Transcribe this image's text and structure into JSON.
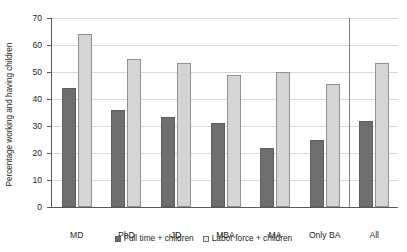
{
  "chart_data": {
    "type": "bar",
    "title": "",
    "xlabel": "",
    "ylabel": "Percentage working and having children",
    "ylim": [
      0,
      70
    ],
    "yticks": [
      0,
      10,
      20,
      30,
      40,
      50,
      60,
      70
    ],
    "grid": true,
    "legend_position": "bottom",
    "categories": [
      "MD",
      "PhD",
      "JD",
      "MBA",
      "MA",
      "Only BA",
      "All"
    ],
    "series": [
      {
        "name": "Full time + children",
        "color": "#6e6e6e",
        "values": [
          44,
          36,
          33.5,
          31,
          22,
          25,
          32
        ]
      },
      {
        "name": "Labor force + children",
        "color": "#d5d5d5",
        "values": [
          64,
          55,
          53.5,
          49,
          50,
          45.5,
          53.5
        ]
      }
    ],
    "separator_after_category": "Only BA"
  }
}
